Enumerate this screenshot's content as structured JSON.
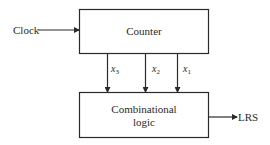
{
  "diagram": {
    "blocks": [
      {
        "id": "counter",
        "label": "Counter"
      },
      {
        "id": "combinational-logic",
        "label_lines": [
          "Combinational",
          "logic"
        ]
      }
    ],
    "inputs": [
      {
        "label": "Clock",
        "to": "counter"
      }
    ],
    "outputs": [
      {
        "label": "LRS",
        "from": "combinational-logic"
      }
    ],
    "signals": [
      {
        "name": "x",
        "sub": "3",
        "from": "counter",
        "to": "combinational-logic"
      },
      {
        "name": "x",
        "sub": "2",
        "from": "counter",
        "to": "combinational-logic"
      },
      {
        "name": "x",
        "sub": "1",
        "from": "counter",
        "to": "combinational-logic"
      }
    ],
    "colors": {
      "line": "#2a2a2a",
      "background": "#ffffff"
    }
  }
}
